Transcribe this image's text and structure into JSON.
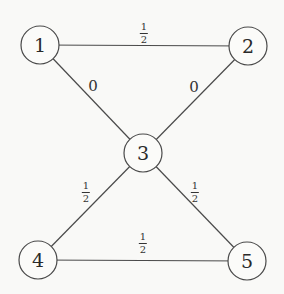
{
  "diagram": {
    "type": "weighted-undirected-graph",
    "nodes": [
      {
        "id": "1",
        "label": "1",
        "x": 40,
        "y": 45
      },
      {
        "id": "2",
        "label": "2",
        "x": 248,
        "y": 46
      },
      {
        "id": "3",
        "label": "3",
        "x": 143,
        "y": 153
      },
      {
        "id": "4",
        "label": "4",
        "x": 38,
        "y": 260
      },
      {
        "id": "5",
        "label": "5",
        "x": 247,
        "y": 261
      }
    ],
    "edges": [
      {
        "from": "1",
        "to": "2",
        "weight": "1/2",
        "weight_num": "1",
        "weight_den": "2"
      },
      {
        "from": "1",
        "to": "3",
        "weight": "0"
      },
      {
        "from": "2",
        "to": "3",
        "weight": "0"
      },
      {
        "from": "3",
        "to": "4",
        "weight": "1/2",
        "weight_num": "1",
        "weight_den": "2"
      },
      {
        "from": "3",
        "to": "5",
        "weight": "1/2",
        "weight_num": "1",
        "weight_den": "2"
      },
      {
        "from": "4",
        "to": "5",
        "weight": "1/2",
        "weight_num": "1",
        "weight_den": "2"
      }
    ]
  }
}
